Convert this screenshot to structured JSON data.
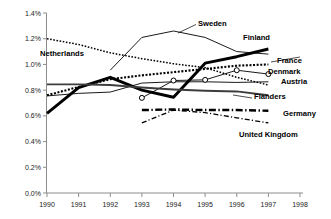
{
  "chart_data": {
    "type": "line",
    "title": "",
    "xlabel": "",
    "ylabel": "",
    "x": [
      1990,
      1991,
      1992,
      1993,
      1994,
      1995,
      1996,
      1997
    ],
    "xlim": [
      1990,
      1998
    ],
    "ylim": [
      0.0,
      1.4
    ],
    "y_unit": "%",
    "grid": false,
    "legend_position": "inline-right",
    "x_ticks": [
      "1990",
      "1991",
      "1992",
      "1993",
      "1994",
      "1995",
      "1996",
      "1997",
      "1998"
    ],
    "y_ticks": [
      "0.0%",
      "0.2%",
      "0.4%",
      "0.6%",
      "0.8%",
      "1.0%",
      "1.2%",
      "1.4%"
    ],
    "series": [
      {
        "name": "Finland",
        "style": "solid-bold",
        "x": [
          1990,
          1991,
          1992,
          1993,
          1994,
          1995,
          1996,
          1997
        ],
        "values": [
          0.62,
          0.82,
          0.9,
          0.8,
          0.745,
          1.01,
          1.06,
          1.12
        ]
      },
      {
        "name": "Sweden",
        "style": "solid-thin",
        "x": [
          1992,
          1993,
          1994,
          1995,
          1996,
          1997
        ],
        "values": [
          0.955,
          1.21,
          1.26,
          1.21,
          1.1,
          1.08
        ]
      },
      {
        "name": "Netherlands",
        "style": "dotted-fine",
        "x": [
          1990,
          1991,
          1992,
          1993,
          1994,
          1995,
          1996,
          1997
        ],
        "values": [
          1.2,
          1.155,
          1.09,
          1.045,
          1.005,
          0.975,
          0.9,
          0.84
        ]
      },
      {
        "name": "France",
        "style": "dotted-bold",
        "x": [
          1990,
          1991,
          1992,
          1993,
          1994,
          1995,
          1996,
          1997
        ],
        "values": [
          0.76,
          0.825,
          0.885,
          0.915,
          0.94,
          0.965,
          0.99,
          1.0
        ]
      },
      {
        "name": "Denmark",
        "style": "solid-thin-marker",
        "x": [
          1993,
          1994,
          1995,
          1996,
          1997
        ],
        "values": [
          0.74,
          0.875,
          0.88,
          0.955,
          0.925
        ]
      },
      {
        "name": "Austria",
        "style": "solid-thin",
        "x": [
          1990,
          1991,
          1992,
          1993,
          1994,
          1995,
          1996,
          1997
        ],
        "values": [
          0.755,
          0.775,
          0.785,
          0.855,
          0.865,
          0.865,
          0.86,
          0.865
        ]
      },
      {
        "name": "Flanders",
        "style": "solid-medium",
        "x": [
          1990,
          1991,
          1992,
          1993,
          1994,
          1995,
          1996,
          1997
        ],
        "values": [
          0.845,
          0.845,
          0.84,
          0.82,
          0.805,
          0.795,
          0.79,
          0.76
        ]
      },
      {
        "name": "Germany",
        "style": "dashdot-bold",
        "x": [
          1993,
          1994,
          1995,
          1996,
          1997
        ],
        "values": [
          0.645,
          0.65,
          0.645,
          0.645,
          0.64
        ]
      },
      {
        "name": "United Kingdom",
        "style": "dashdot-thin",
        "x": [
          1993,
          1994,
          1995,
          1996,
          1997
        ],
        "values": [
          0.545,
          0.645,
          0.625,
          0.585,
          0.545
        ]
      }
    ],
    "labels": [
      {
        "name": "Sweden",
        "text": "Sweden",
        "x": 198,
        "y": 26
      },
      {
        "name": "Finland",
        "text": "Finland",
        "x": 243,
        "y": 40
      },
      {
        "name": "Netherlands",
        "text": "Netherlands",
        "x": 40,
        "y": 56
      },
      {
        "name": "France",
        "text": "France",
        "x": 277,
        "y": 63
      },
      {
        "name": "Denmark",
        "text": "Denmark",
        "x": 268,
        "y": 74
      },
      {
        "name": "Austria",
        "text": "Austria",
        "x": 281,
        "y": 84
      },
      {
        "name": "Flanders",
        "text": "Flanders",
        "x": 254,
        "y": 99
      },
      {
        "name": "Germany",
        "text": "Germany",
        "x": 283,
        "y": 116
      },
      {
        "name": "United Kingdom",
        "text": "United Kingdom",
        "x": 239,
        "y": 137
      }
    ]
  }
}
